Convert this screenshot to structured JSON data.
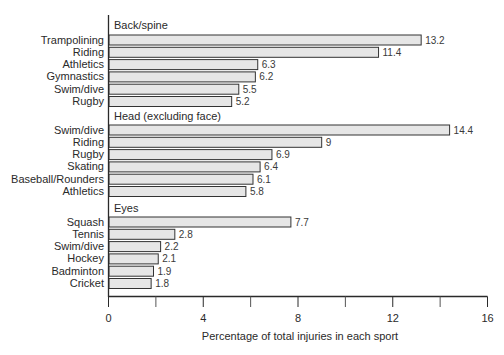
{
  "chart_data": {
    "type": "bar",
    "orientation": "horizontal",
    "title": "",
    "xlabel": "Percentage of total injuries in each sport",
    "ylabel": "",
    "xlim": [
      0,
      16
    ],
    "xticks": [
      0,
      4,
      8,
      12,
      16
    ],
    "minor_xticks": [
      2,
      6,
      10,
      14
    ],
    "grid": false,
    "legend": null,
    "bar_fill": "#e6e6e6",
    "bar_stroke": "#333333",
    "groups": [
      {
        "name": "Back/spine",
        "categories": [
          "Trampolining",
          "Riding",
          "Athletics",
          "Gymnastics",
          "Swim/dive",
          "Rugby"
        ],
        "values": [
          13.2,
          11.4,
          6.3,
          6.2,
          5.5,
          5.2
        ],
        "labels": [
          "13.2",
          "11.4",
          "6.3",
          "6.2",
          "5.5",
          "5.2"
        ]
      },
      {
        "name": "Head (excluding face)",
        "categories": [
          "Swim/dive",
          "Riding",
          "Rugby",
          "Skating",
          "Baseball/Rounders",
          "Athletics"
        ],
        "values": [
          14.4,
          9,
          6.9,
          6.4,
          6.1,
          5.8
        ],
        "labels": [
          "14.4",
          "9",
          "6.9",
          "6.4",
          "6.1",
          "5.8"
        ]
      },
      {
        "name": "Eyes",
        "categories": [
          "Squash",
          "Tennis",
          "Swim/dive",
          "Hockey",
          "Badminton",
          "Cricket"
        ],
        "values": [
          7.7,
          2.8,
          2.2,
          2.1,
          1.9,
          1.8
        ],
        "labels": [
          "7.7",
          "2.8",
          "2.2",
          "2.1",
          "1.9",
          "1.8"
        ]
      }
    ]
  }
}
